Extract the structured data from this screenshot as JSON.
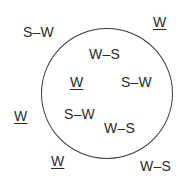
{
  "diagram": {
    "shape": "circle",
    "line_color": "#3a3a3a",
    "background": "#ffffff",
    "inside_labels": [
      {
        "text": "W–S",
        "underlined": false
      },
      {
        "text": "W",
        "underlined": true
      },
      {
        "text": "S–W",
        "underlined": false
      },
      {
        "text": "S–W",
        "underlined": false
      },
      {
        "text": "W–S",
        "underlined": false
      }
    ],
    "outside_labels": [
      {
        "text": "S–W",
        "underlined": false
      },
      {
        "text": "W",
        "underlined": true
      },
      {
        "text": "W",
        "underlined": true
      },
      {
        "text": "W",
        "underlined": true
      },
      {
        "text": "W–S",
        "underlined": false
      }
    ]
  }
}
